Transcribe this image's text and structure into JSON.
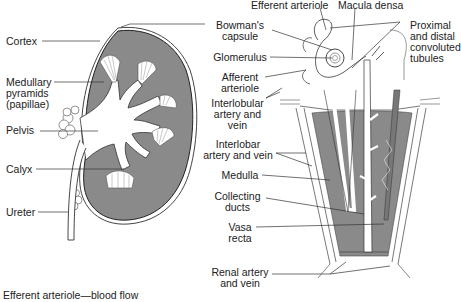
{
  "diagram": {
    "colors": {
      "tissue_gray": "#8a8a8a",
      "line": "#333333",
      "background": "#ffffff"
    },
    "left_labels": [
      {
        "id": "cortex",
        "text": "Cortex"
      },
      {
        "id": "medullary",
        "lines": [
          "Medullary",
          "pyramids",
          "(papillae)"
        ]
      },
      {
        "id": "pelvis",
        "text": "Pelvis"
      },
      {
        "id": "calyx",
        "text": "Calyx"
      },
      {
        "id": "ureter",
        "text": "Ureter"
      }
    ],
    "center_labels": [
      {
        "id": "bowmans",
        "lines": [
          "Bowman's",
          "capsule"
        ]
      },
      {
        "id": "glomerulus",
        "text": "Glomerulus"
      },
      {
        "id": "afferent",
        "lines": [
          "Afferent",
          "arteriole"
        ]
      },
      {
        "id": "interlobular",
        "lines": [
          "Interlobular",
          "artery and",
          "vein"
        ]
      },
      {
        "id": "interlobar",
        "lines": [
          "Interlobar",
          "artery and vein"
        ]
      },
      {
        "id": "medulla",
        "text": "Medulla"
      },
      {
        "id": "collecting",
        "lines": [
          "Collecting",
          "ducts"
        ]
      },
      {
        "id": "vasa",
        "lines": [
          "Vasa",
          "recta"
        ]
      },
      {
        "id": "renal",
        "lines": [
          "Renal artery",
          "and vein"
        ]
      }
    ],
    "top_labels": [
      {
        "id": "efferent",
        "text": "Efferent arteriole"
      },
      {
        "id": "macula",
        "text": "Macula densa"
      }
    ],
    "right_labels": [
      {
        "id": "tubules",
        "lines": [
          "Proximal",
          "and distal",
          "convoluted",
          "tubules"
        ]
      }
    ],
    "caption": "Efferent arteriole—blood flow"
  }
}
